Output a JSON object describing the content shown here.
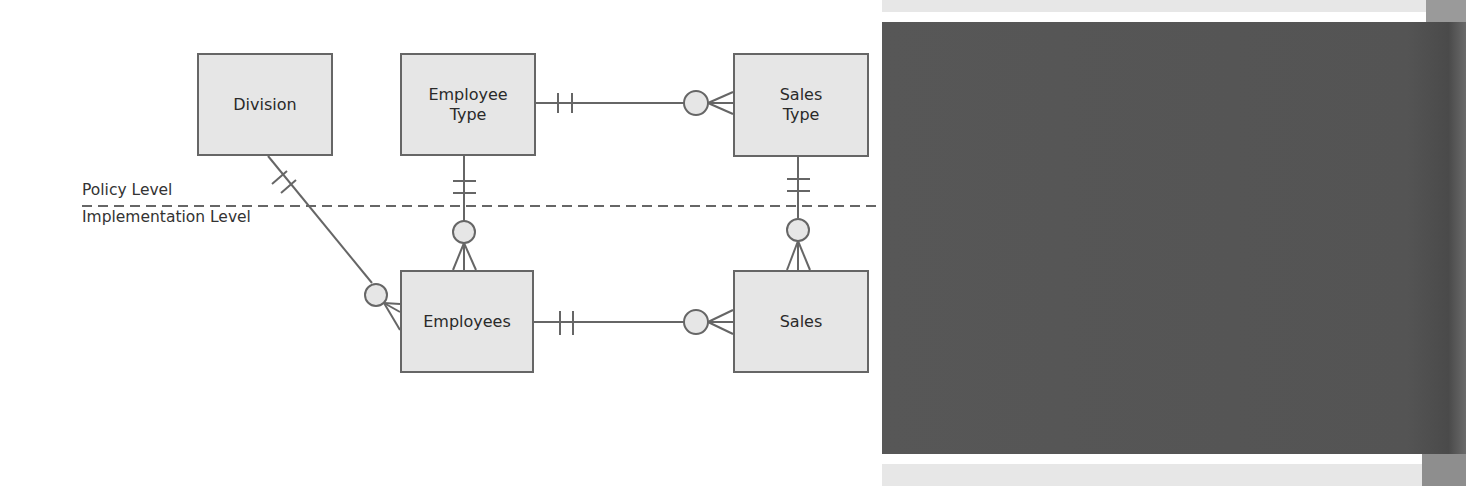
{
  "diagram": {
    "levels": {
      "upper": "Policy Level",
      "lower": "Implementation Level"
    },
    "entities": [
      {
        "id": "division",
        "lines": [
          "Division"
        ]
      },
      {
        "id": "employee-type",
        "lines": [
          "Employee",
          "Type"
        ]
      },
      {
        "id": "sales-type",
        "lines": [
          "Sales",
          "Type"
        ]
      },
      {
        "id": "employees",
        "lines": [
          "Employees"
        ]
      },
      {
        "id": "sales",
        "lines": [
          "Sales"
        ]
      }
    ],
    "relationships": [
      {
        "from": "Division",
        "to": "Employees",
        "from_cardinality": "one-and-only-one",
        "to_cardinality": "zero-or-many"
      },
      {
        "from": "Employee Type",
        "to": "Sales Type",
        "from_cardinality": "one-and-only-one",
        "to_cardinality": "zero-or-many"
      },
      {
        "from": "Employee Type",
        "to": "Employees",
        "from_cardinality": "one-and-only-one",
        "to_cardinality": "zero-or-many"
      },
      {
        "from": "Sales Type",
        "to": "Sales",
        "from_cardinality": "one-and-only-one",
        "to_cardinality": "zero-or-many"
      },
      {
        "from": "Employees",
        "to": "Sales",
        "from_cardinality": "one-and-only-one",
        "to_cardinality": "zero-or-many"
      }
    ],
    "colors": {
      "entity_fill": "#e6e6e6",
      "line": "#666666",
      "text": "#2a2a2a",
      "panel_dark": "#555555",
      "panel_light": "#e7e7e7"
    }
  }
}
